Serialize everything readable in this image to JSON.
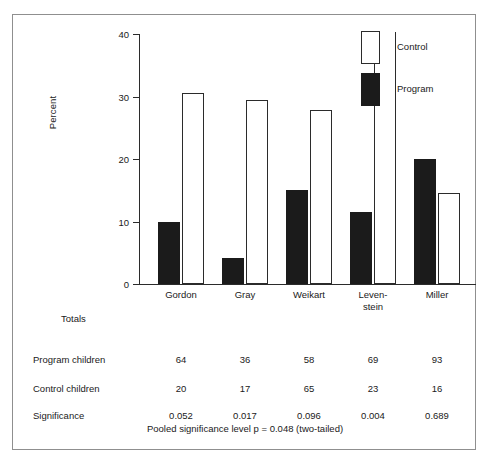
{
  "chart_data": {
    "type": "bar",
    "title": "",
    "xlabel": "",
    "ylabel": "Percent",
    "ylim": [
      0,
      40
    ],
    "yticks": [
      0,
      10,
      20,
      30,
      40
    ],
    "ytick_labels": [
      "0",
      "10",
      "20",
      "30",
      "40"
    ],
    "grid": false,
    "legend_position": "top-right",
    "categories": [
      "Gordon",
      "Gray",
      "Weikart",
      "Leven-\nstein",
      "Miller"
    ],
    "category_labels": [
      "Gordon",
      "Gray",
      "Weikart",
      "Leven-stein",
      "Miller"
    ],
    "series": [
      {
        "name": "Program",
        "color": "#1b1b1b",
        "values": [
          10.0,
          4.2,
          15.0,
          11.5,
          20.0
        ]
      },
      {
        "name": "Control",
        "color": "#ffffff",
        "values": [
          30.6,
          29.5,
          27.8,
          40.5,
          14.5
        ]
      }
    ]
  },
  "legend": {
    "entries": [
      {
        "label": "Control",
        "swatch": "control"
      },
      {
        "label": "Program",
        "swatch": "program"
      }
    ]
  },
  "table": {
    "totals_header": "Totals",
    "columns": [
      "Gordon",
      "Gray",
      "Weikart",
      "Leven-stein",
      "Miller"
    ],
    "rows": [
      {
        "label": "Program children",
        "values": [
          "64",
          "36",
          "58",
          "69",
          "93"
        ]
      },
      {
        "label": "Control children",
        "values": [
          "20",
          "17",
          "65",
          "23",
          "16"
        ]
      },
      {
        "label": "Significance",
        "values": [
          "0.052",
          "0.017",
          "0.096",
          "0.004",
          "0.689"
        ]
      }
    ]
  },
  "footer": {
    "note": "Pooled significance level p =  0.048 (two-tailed)"
  },
  "colors": {
    "program_fill": "#1b1b1b",
    "control_fill": "#ffffff",
    "axis": "#2b2b2b",
    "frame": "#8f8f8f",
    "text": "#1a1a1a"
  }
}
